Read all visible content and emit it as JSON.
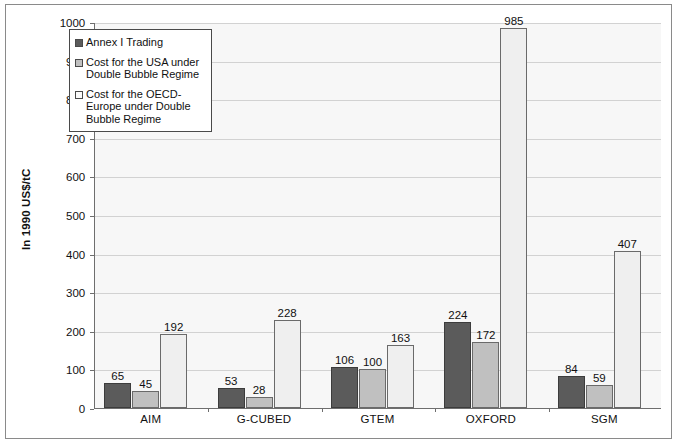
{
  "chart_data": {
    "type": "bar",
    "title": "",
    "xlabel": "",
    "ylabel": "In 1990 US$/tC",
    "ylim": [
      0,
      1000
    ],
    "yticks": [
      0,
      100,
      200,
      300,
      400,
      500,
      600,
      700,
      800,
      900,
      1000
    ],
    "ytick_labels": [
      "0",
      "100",
      "200",
      "300",
      "400",
      "500",
      "600",
      "700",
      "800",
      "900",
      "1000"
    ],
    "grid": true,
    "legend_position": "upper-left-inside",
    "categories": [
      "AIM",
      "G-CUBED",
      "GTEM",
      "OXFORD",
      "SGM"
    ],
    "series": [
      {
        "name": "Annex I Trading",
        "color": "#5b5b5b",
        "values": [
          65,
          53,
          106,
          224,
          84
        ],
        "labels": [
          "65",
          "53",
          "106",
          "224",
          "84"
        ]
      },
      {
        "name": "Cost for the USA under Double Bubble Regime",
        "color": "#c0c0c0",
        "values": [
          45,
          28,
          100,
          172,
          59
        ],
        "labels": [
          "45",
          "28",
          "100",
          "172",
          "59"
        ]
      },
      {
        "name": "Cost for the OECD-Europe under Double Bubble Regime",
        "color": "#efefef",
        "values": [
          192,
          228,
          163,
          985,
          407
        ],
        "labels": [
          "192",
          "228",
          "163",
          "985",
          "407"
        ]
      }
    ]
  },
  "legend": {
    "items": [
      {
        "label": "Annex I Trading",
        "swatch": "dark-gray-swatch"
      },
      {
        "label": "Cost for the USA under Double Bubble Regime",
        "swatch": "medium-gray-swatch"
      },
      {
        "label": "Cost for the OECD-Europe under Double Bubble Regime",
        "swatch": "light-gray-swatch"
      }
    ]
  },
  "axis": {
    "y_title": "In 1990 US$/tC"
  }
}
